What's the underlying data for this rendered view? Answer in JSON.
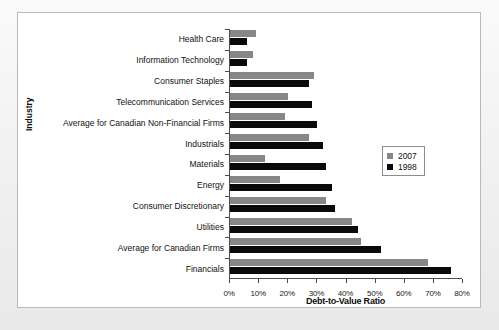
{
  "chart_data": {
    "type": "bar",
    "orientation": "horizontal",
    "title": "",
    "xlabel": "Debt-to-Value Ratio",
    "ylabel": "Industry",
    "xlim": [
      0,
      80
    ],
    "xtick_labels": [
      "0%",
      "10%",
      "20%",
      "30%",
      "40%",
      "50%",
      "60%",
      "70%",
      "80%"
    ],
    "xtick_values": [
      0,
      10,
      20,
      30,
      40,
      50,
      60,
      70,
      80
    ],
    "grid": false,
    "legend_position": "center-right",
    "categories": [
      "Health Care",
      "Information Technology",
      "Consumer Staples",
      "Telecommunication Services",
      "Average for Canadian Non-Financial Firms",
      "Industrials",
      "Materials",
      "Energy",
      "Consumer Discretionary",
      "Utilities",
      "Average for Canadian Firms",
      "Financials"
    ],
    "series": [
      {
        "name": "2007",
        "color": "#878787",
        "values": [
          9,
          8,
          29,
          20,
          19,
          27,
          12,
          17,
          33,
          42,
          45,
          68
        ]
      },
      {
        "name": "1998",
        "color": "#0a0a0a",
        "values": [
          6,
          6,
          27,
          28,
          30,
          32,
          33,
          35,
          36,
          44,
          52,
          76
        ]
      }
    ]
  }
}
